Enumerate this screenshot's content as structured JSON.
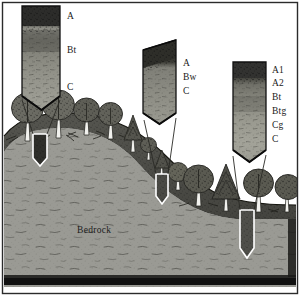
{
  "figure": {
    "width": 301,
    "height": 297,
    "frame_color": "#2b2b2b",
    "background_color": "#ffffff",
    "base_color": "#111111"
  },
  "terrain": {
    "bedrock_label": "Bedrock",
    "bedrock_color": "#9a9a94",
    "topsoil_color": "#4d4d4a",
    "sky_color": "#ffffff",
    "slope_description": "hillcrest on left descending to lowland flat on right"
  },
  "profiles": [
    {
      "id": "summit",
      "position": "upper-left",
      "pit_label": "summit pit",
      "horizons": [
        {
          "label": "A",
          "color": "#3a3a38",
          "thickness": 22
        },
        {
          "label": "Bt",
          "color": "#87877f",
          "thickness": 45
        },
        {
          "label": "C",
          "color": "#9b9b92",
          "thickness": 38
        }
      ]
    },
    {
      "id": "backslope",
      "position": "upper-middle",
      "pit_label": "backslope pit",
      "horizons": [
        {
          "label": "A",
          "color": "#35352f",
          "thickness": 16
        },
        {
          "label": "Bw",
          "color": "#7d7d75",
          "thickness": 24
        },
        {
          "label": "C",
          "color": "#96968d",
          "thickness": 22
        }
      ]
    },
    {
      "id": "footslope",
      "position": "upper-right",
      "pit_label": "footslope pit",
      "horizons": [
        {
          "label": "A1",
          "color": "#3a3a35",
          "thickness": 15
        },
        {
          "label": "A2",
          "color": "#6e6e66",
          "thickness": 14
        },
        {
          "label": "Bt",
          "color": "#8a8a81",
          "thickness": 16
        },
        {
          "label": "Btg",
          "color": "#9a9a90",
          "thickness": 16
        },
        {
          "label": "Cg",
          "color": "#a4a49a",
          "thickness": 16
        },
        {
          "label": "C",
          "color": "#9d9d93",
          "thickness": 16
        }
      ]
    }
  ],
  "vegetation": {
    "canopy_color": "#6b6b63",
    "canopy_dark": "#45453f",
    "trunk_color": "#efefea",
    "conifer_color": "#55554e",
    "counts": {
      "summit_deciduous": 5,
      "summit_conifer": 2,
      "slope_trees": 4,
      "lowland_trees": 4
    }
  }
}
